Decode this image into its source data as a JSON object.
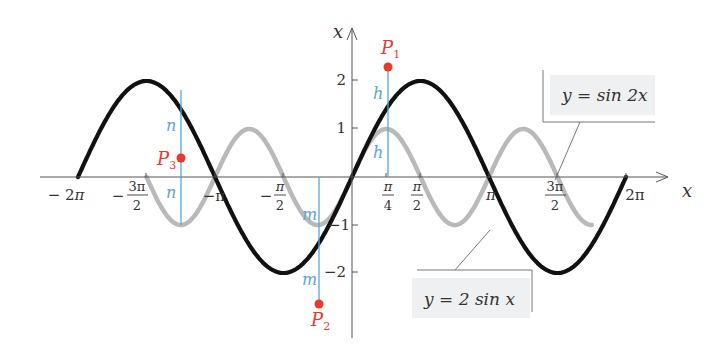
{
  "chart_data": {
    "type": "line",
    "title": "",
    "xlabel": "x",
    "ylabel": "y",
    "xlim": [
      -6.2832,
      6.2832
    ],
    "ylim": [
      -2.6,
      2.6
    ],
    "grid": false,
    "x_ticks": [
      "-2π",
      "-3π/2",
      "-π",
      "-π/2",
      "π/4",
      "π/2",
      "π",
      "3π/2",
      "2π"
    ],
    "x_tick_values": [
      -6.2832,
      -4.7124,
      -3.1416,
      -1.5708,
      0.7854,
      1.5708,
      3.1416,
      4.7124,
      6.2832
    ],
    "y_ticks": [
      "-2",
      "-1",
      "1",
      "2"
    ],
    "y_tick_values": [
      -2,
      -1,
      1,
      2
    ],
    "series": [
      {
        "name": "y = 2 sin x",
        "color": "#111111",
        "stroke_width": 4,
        "expr": "2*sin(x)",
        "domain": [
          -6.2832,
          6.2832
        ]
      },
      {
        "name": "y = sin 2x",
        "color": "#b8b8b8",
        "stroke_width": 4,
        "expr": "sin(2*x)",
        "domain": [
          -4.7124,
          5.4978
        ]
      }
    ],
    "annotations": [
      {
        "type": "point",
        "label": "P1",
        "x": 0.7854,
        "y": 2.3,
        "color": "#e8392a"
      },
      {
        "type": "point",
        "label": "P2",
        "x": -0.7854,
        "y": -2.6,
        "color": "#e8392a"
      },
      {
        "type": "point",
        "label": "P3",
        "x": -3.927,
        "y": 0.4,
        "color": "#e8392a"
      },
      {
        "type": "segment",
        "label": "h",
        "x": 0.7854,
        "from": 0,
        "to": 1,
        "color": "#5aa6d8"
      },
      {
        "type": "segment",
        "label": "h",
        "x": 0.7854,
        "from": 1,
        "to": 2.3,
        "color": "#5aa6d8"
      },
      {
        "type": "segment",
        "label": "m",
        "x": -0.7854,
        "from": 0,
        "to": -1,
        "color": "#5aa6d8"
      },
      {
        "type": "segment",
        "label": "m",
        "x": -0.7854,
        "from": -1,
        "to": -2.6,
        "color": "#5aa6d8"
      },
      {
        "type": "segment",
        "label": "n",
        "x": -3.927,
        "from": 0,
        "to": -1,
        "color": "#5aa6d8"
      },
      {
        "type": "segment",
        "label": "n",
        "x": -3.927,
        "from": 0,
        "to": 1.4,
        "color": "#5aa6d8"
      }
    ],
    "legend": [
      {
        "text": "y = sin 2x",
        "position": "upper-right"
      },
      {
        "text": "y = 2 sin x",
        "position": "lower-center-right"
      }
    ]
  },
  "labels": {
    "x_axis": "x",
    "y_axis": "y",
    "ticks": {
      "neg2pi_a": "− 2",
      "neg2pi_b": "π",
      "neg3pi2_sign": "−",
      "neg3pi2_num": "3π",
      "neg3pi2_den": "2",
      "negpi": "−π",
      "negpi2_sign": "−",
      "negpi2_num": "π",
      "negpi2_den": "2",
      "pi4_num": "π",
      "pi4_den": "4",
      "pi2_num": "π",
      "pi2_den": "2",
      "pi": "π",
      "threepi2_num": "3π",
      "threepi2_den": "2",
      "twopi": "2π",
      "y2": "2",
      "y1": "1",
      "yneg1": "−1",
      "yneg2": "−2"
    },
    "points": {
      "p1": "P",
      "p1_sub": "1",
      "p2": "P",
      "p2_sub": "2",
      "p3": "P",
      "p3_sub": "3"
    },
    "segments": {
      "h": "h",
      "m": "m",
      "n": "n"
    },
    "legend_sin2x": "y = sin 2x",
    "legend_2sinx": "y = 2 sin x"
  }
}
